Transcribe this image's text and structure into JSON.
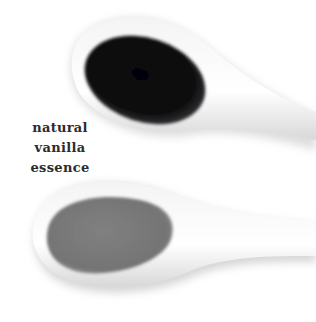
{
  "label": {
    "lines": [
      "natural",
      "vanilla",
      "essence"
    ]
  },
  "image": {
    "subject": "two white ceramic spoons",
    "top_spoon": {
      "contents": "dark vanilla extract",
      "color": "#0d0d0f"
    },
    "bottom_spoon": {
      "contents": "lighter vanilla essence",
      "color": "#7a7a7a"
    },
    "background_color": "#ffffff"
  }
}
